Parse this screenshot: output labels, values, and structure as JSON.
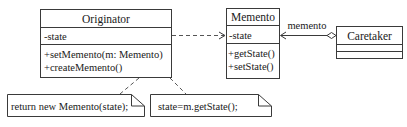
{
  "diagram": {
    "type": "uml-class-diagram",
    "pattern": "Memento",
    "colors": {
      "stroke": "#3a3a3a",
      "text": "#1a1a1a",
      "background": "#ffffff"
    },
    "classes": [
      {
        "id": "originator",
        "name": "Originator",
        "attributes": [
          "-state"
        ],
        "operations": [
          "+setMemento(m: Memento)",
          "+createMemento()"
        ]
      },
      {
        "id": "memento",
        "name": "Memento",
        "attributes": [
          "-state"
        ],
        "operations": [
          "+getState()",
          "+setState()"
        ]
      },
      {
        "id": "caretaker",
        "name": "Caretaker",
        "attributes": [],
        "operations": []
      }
    ],
    "relationships": [
      {
        "type": "dependency",
        "from": "Originator",
        "to": "Memento",
        "style": "dashed-open-arrow"
      },
      {
        "type": "aggregation",
        "from": "Caretaker",
        "to": "Memento",
        "label": "memento",
        "style": "hollow-diamond-open-arrow"
      }
    ],
    "notes": [
      {
        "id": "note-create",
        "text": "return new Memento(state);",
        "attached_to": "Originator.createMemento()"
      },
      {
        "id": "note-set",
        "text": "state=m.getState();",
        "attached_to": "Originator.setMemento(m: Memento)"
      }
    ]
  }
}
